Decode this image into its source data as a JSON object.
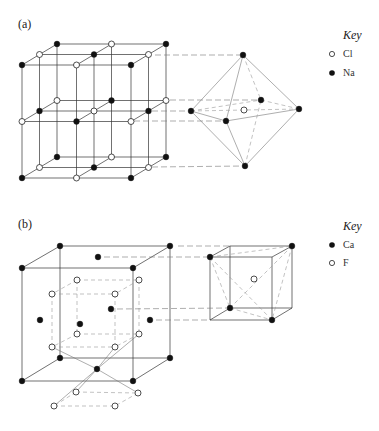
{
  "panel_a": {
    "label": "(a)",
    "key": {
      "title": "Key",
      "items": [
        {
          "symbol": "open-circle",
          "label": "Cl"
        },
        {
          "symbol": "filled-circle",
          "label": "Na"
        }
      ]
    },
    "structure": "NaCl rock-salt lattice with octahedral coordination"
  },
  "panel_b": {
    "label": "(b)",
    "key": {
      "title": "Key",
      "items": [
        {
          "symbol": "filled-circle",
          "label": "Ca"
        },
        {
          "symbol": "open-circle",
          "label": "F"
        }
      ]
    },
    "structure": "CaF2 fluorite lattice with cubic coordination"
  }
}
